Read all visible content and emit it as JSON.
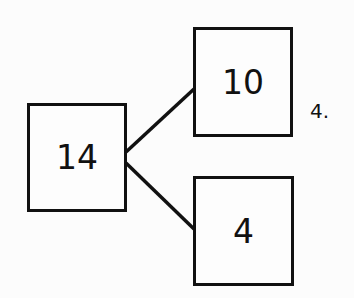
{
  "diagram": {
    "type": "number-bond",
    "whole": {
      "value": "14"
    },
    "parts": [
      {
        "value": "10"
      },
      {
        "value": "4"
      }
    ],
    "problem_label": "4."
  },
  "colors": {
    "stroke": "#111111",
    "background": "#fcfcfc"
  }
}
